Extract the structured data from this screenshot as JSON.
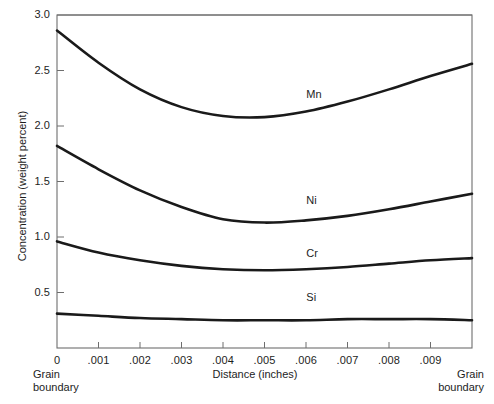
{
  "chart_data": {
    "type": "line",
    "title": "",
    "xlabel": "Distance (inches)",
    "ylabel": "Concentration (weight percent)",
    "xlim": [
      0,
      0.01
    ],
    "ylim": [
      0,
      3.0
    ],
    "grid": false,
    "legend_position": "inline-labels",
    "x_ticks": [
      "0",
      ".001",
      ".002",
      ".003",
      ".004",
      ".005",
      ".006",
      ".007",
      ".008",
      ".009"
    ],
    "x_tick_values": [
      0,
      0.001,
      0.002,
      0.003,
      0.004,
      0.005,
      0.006,
      0.007,
      0.008,
      0.009
    ],
    "y_ticks": [
      "0.5",
      "1.0",
      "1.5",
      "2.0",
      "2.5",
      "3.0"
    ],
    "y_tick_values": [
      0.5,
      1.0,
      1.5,
      2.0,
      2.5,
      3.0
    ],
    "annotations": [
      {
        "text": "Grain boundary",
        "position": "left-end-of-x-axis"
      },
      {
        "text": "Grain boundary",
        "position": "right-end-of-x-axis"
      }
    ],
    "x": [
      0,
      0.001,
      0.002,
      0.003,
      0.004,
      0.005,
      0.006,
      0.007,
      0.008,
      0.009,
      0.01
    ],
    "series": [
      {
        "name": "Mn",
        "color": "#1a1a1a",
        "label_x": 0.0062,
        "label_y": 2.28,
        "values": [
          2.86,
          2.57,
          2.33,
          2.17,
          2.09,
          2.08,
          2.13,
          2.22,
          2.33,
          2.45,
          2.56
        ]
      },
      {
        "name": "Ni",
        "color": "#1a1a1a",
        "label_x": 0.0062,
        "label_y": 1.32,
        "values": [
          1.82,
          1.61,
          1.42,
          1.27,
          1.16,
          1.13,
          1.15,
          1.19,
          1.25,
          1.32,
          1.39
        ]
      },
      {
        "name": "Cr",
        "color": "#1a1a1a",
        "label_x": 0.0062,
        "label_y": 0.85,
        "values": [
          0.96,
          0.86,
          0.79,
          0.74,
          0.71,
          0.7,
          0.71,
          0.73,
          0.76,
          0.79,
          0.81
        ]
      },
      {
        "name": "Si",
        "color": "#1a1a1a",
        "label_x": 0.0062,
        "label_y": 0.45,
        "values": [
          0.31,
          0.29,
          0.27,
          0.26,
          0.25,
          0.25,
          0.25,
          0.26,
          0.26,
          0.26,
          0.25
        ]
      }
    ]
  },
  "axes": {
    "frame_color": "#6e6e6e",
    "curve_color": "#1a1a1a"
  }
}
